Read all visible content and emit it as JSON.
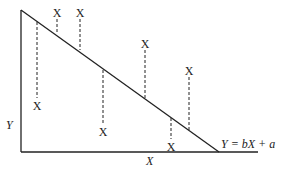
{
  "diagram": {
    "type": "scatter-with-regression",
    "axes": {
      "y_label": "Y",
      "x_label": "X"
    },
    "regression_line": {
      "equation": "Y = bX + a"
    },
    "point_marker": "X",
    "points": [
      {
        "marker": "X",
        "cx": 37,
        "cy": 105,
        "line_from": 22,
        "line_to": 98
      },
      {
        "marker": "X",
        "cx": 57,
        "cy": 12,
        "line_from": 19,
        "line_to": 33
      },
      {
        "marker": "X",
        "cx": 80,
        "cy": 12,
        "line_from": 19,
        "line_to": 50
      },
      {
        "marker": "X",
        "cx": 103,
        "cy": 131,
        "line_from": 70,
        "line_to": 124
      },
      {
        "marker": "X",
        "cx": 145,
        "cy": 43,
        "line_from": 50,
        "line_to": 100
      },
      {
        "marker": "X",
        "cx": 189,
        "cy": 70,
        "line_from": 77,
        "line_to": 132
      },
      {
        "marker": "X",
        "cx": 171,
        "cy": 146,
        "line_from": 118,
        "line_to": 139
      }
    ],
    "colors": {
      "stroke": "#222222",
      "background": "#ffffff"
    }
  }
}
